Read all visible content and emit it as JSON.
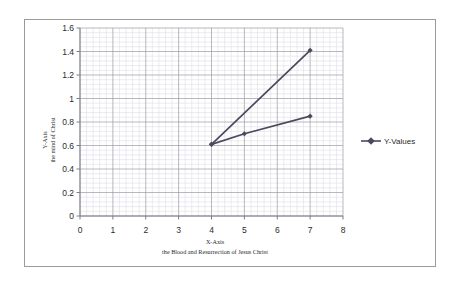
{
  "chart_data": {
    "type": "line",
    "title": "",
    "xlabel": "X-Axis",
    "xlabel_sub": "the Blood and Resurrection of Jesus Christ",
    "ylabel": "Y-Axis",
    "ylabel_sub": "the mind of Christ",
    "xlim": [
      0,
      8
    ],
    "ylim": [
      0,
      1.6
    ],
    "xticks": [
      "0",
      "1",
      "2",
      "3",
      "4",
      "5",
      "6",
      "7",
      "8"
    ],
    "xtick_values": [
      0,
      1,
      2,
      3,
      4,
      5,
      6,
      7,
      8
    ],
    "yticks": [
      "0",
      "0.2",
      "0.4",
      "0.6",
      "0.8",
      "1",
      "1.2",
      "1.4",
      "1.6"
    ],
    "ytick_values": [
      0,
      0.2,
      0.4,
      0.6,
      0.8,
      1,
      1.2,
      1.4,
      1.6
    ],
    "grid": true,
    "grid_major": true,
    "grid_minor": true,
    "minor_divisions": 5,
    "legend": [
      "Y-Values"
    ],
    "legend_position": "right",
    "series": [
      {
        "name": "Y-Values",
        "x": [
          4,
          7
        ],
        "values": [
          0.61,
          1.41
        ],
        "color": "#4a4a5e",
        "marker": "diamond"
      },
      {
        "name": "Y-Values",
        "x": [
          4,
          5,
          7
        ],
        "values": [
          0.61,
          0.7,
          0.85
        ],
        "color": "#4a4a5e",
        "marker": "diamond"
      }
    ]
  },
  "legend": {
    "entry_label": "Y-Values",
    "marker_color": "#4a4a5e"
  },
  "colors": {
    "series": "#4a4a5e",
    "grid_major": "#9a9aa8",
    "grid_minor": "#d8d8e0",
    "axis": "#7f7f8c",
    "frame": "#9a9a9a",
    "text": "#2b2b2b"
  }
}
